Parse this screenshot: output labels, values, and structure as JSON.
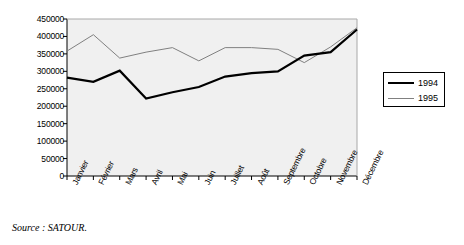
{
  "chart_data": {
    "type": "line",
    "title": "",
    "xlabel": "",
    "ylabel": "",
    "categories": [
      "Janvier",
      "Février",
      "Mars",
      "Avril",
      "Mai",
      "Juin",
      "Juillet",
      "Août",
      "Septembre",
      "Octobre",
      "Novembre",
      "Décembre"
    ],
    "ylim": [
      0,
      450000
    ],
    "yticks": [
      450000,
      400000,
      350000,
      300000,
      250000,
      200000,
      150000,
      100000,
      50000,
      0
    ],
    "ytick_labels": [
      "450000",
      "400000",
      "350000",
      "300000",
      "250000",
      "200000",
      "150000",
      "100000",
      "50000",
      "0"
    ],
    "grid": false,
    "legend_position": "right",
    "plot_background": "#f0f0f0",
    "series": [
      {
        "name": "1994",
        "color": "#000000",
        "width": 2.2,
        "values": [
          282000,
          270000,
          302000,
          222000,
          240000,
          255000,
          285000,
          295000,
          300000,
          345000,
          355000,
          420000
        ]
      },
      {
        "name": "1995",
        "color": "#808080",
        "width": 1.0,
        "values": [
          358000,
          405000,
          338000,
          355000,
          368000,
          330000,
          368000,
          368000,
          363000,
          325000,
          370000,
          425000
        ]
      }
    ]
  },
  "legend": {
    "entries": [
      {
        "label": "1994"
      },
      {
        "label": "1995"
      }
    ]
  },
  "caption": {
    "source": "Source : SATOUR."
  },
  "colors": {
    "axis": "#000000",
    "series_1994": "#000000",
    "series_1995": "#808080",
    "plot_bg": "#f0f0f0",
    "page_bg": "#ffffff"
  }
}
